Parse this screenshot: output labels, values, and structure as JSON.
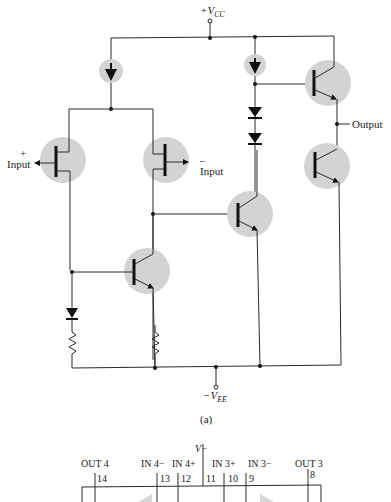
{
  "figure": {
    "caption": "(a)",
    "supply_positive": {
      "label": "+V",
      "subscript": "CC"
    },
    "supply_negative": {
      "label": "−V",
      "subscript": "EE"
    },
    "labels": {
      "input_plus_sign": "+",
      "input_plus": "Input",
      "input_minus_sign": "−",
      "input_minus": "Input",
      "output": "Output"
    },
    "colors": {
      "device_highlight": "#d3d3d3",
      "wire": "#2a2a2a"
    },
    "components": [
      {
        "type": "current-source",
        "id": "I1"
      },
      {
        "type": "current-source",
        "id": "I2"
      },
      {
        "type": "p-jfet",
        "id": "J1",
        "role": "non-inverting input"
      },
      {
        "type": "p-jfet",
        "id": "J2",
        "role": "inverting input"
      },
      {
        "type": "npn-bjt",
        "id": "Q1"
      },
      {
        "type": "npn-bjt",
        "id": "Q2"
      },
      {
        "type": "npn-bjt",
        "id": "Q3",
        "role": "output pull-up"
      },
      {
        "type": "pnp-bjt",
        "id": "Q4",
        "role": "output pull-down"
      },
      {
        "type": "diode",
        "id": "D1"
      },
      {
        "type": "diode",
        "id": "D2"
      },
      {
        "type": "diode",
        "id": "D3"
      },
      {
        "type": "resistor",
        "id": "R1"
      },
      {
        "type": "resistor",
        "id": "R2"
      }
    ]
  },
  "pinout": {
    "supply_label": "V−",
    "top_labels": [
      {
        "text": "OUT 4"
      },
      {
        "text": "IN 4−"
      },
      {
        "text": "IN 4+"
      },
      {
        "text": "IN 3+"
      },
      {
        "text": "IN 3−"
      },
      {
        "text": "OUT 3"
      }
    ],
    "pins": [
      "14",
      "13",
      "12",
      "11",
      "10",
      "9",
      "8"
    ]
  }
}
